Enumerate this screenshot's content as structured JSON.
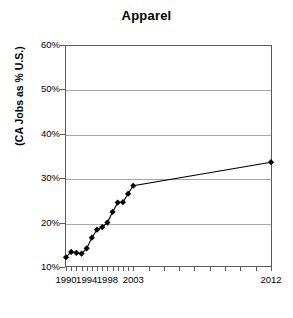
{
  "chart_data": {
    "type": "line",
    "title": "Apparel",
    "xlabel": "",
    "ylabel": "(CA Jobs as % U.S.)",
    "grid": true,
    "legend": null,
    "marker": "filled-diamond",
    "line_color": "#000000",
    "marker_color": "#000000",
    "ylim": [
      10,
      60
    ],
    "yticks": [
      10,
      20,
      30,
      40,
      50,
      60
    ],
    "ytick_labels": [
      "10%",
      "20%",
      "30%",
      "40%",
      "50%",
      "60%"
    ],
    "xtick_labels": [
      "1990",
      "1994",
      "1998",
      "2003",
      "2012"
    ],
    "xtick_values": [
      1990,
      1994,
      1998,
      2003,
      2012
    ],
    "x": [
      1990,
      1991,
      1992,
      1993,
      1994,
      1995,
      1996,
      1997,
      1998,
      1999,
      2000,
      2001,
      2002,
      2003,
      2012
    ],
    "categories": [
      "1990",
      "1991",
      "1992",
      "1993",
      "1994",
      "1995",
      "1996",
      "1997",
      "1998",
      "1999",
      "2000",
      "2001",
      "2002",
      "2003",
      "2012"
    ],
    "values": [
      12.2,
      13.4,
      13.2,
      13.0,
      14.2,
      16.6,
      18.4,
      19.0,
      20.0,
      22.4,
      24.5,
      24.6,
      26.5,
      28.3,
      33.6
    ],
    "series": [
      {
        "name": "CA Jobs as % U.S.",
        "values": [
          12.2,
          13.4,
          13.2,
          13.0,
          14.2,
          16.6,
          18.4,
          19.0,
          20.0,
          22.4,
          24.5,
          24.6,
          26.5,
          28.3,
          33.6
        ]
      }
    ]
  }
}
